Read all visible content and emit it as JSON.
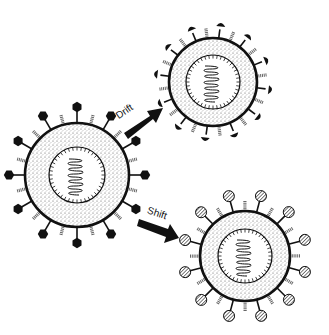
{
  "diagram": {
    "labels": {
      "drift": "Drift",
      "shift": "Shift"
    },
    "viruses": [
      {
        "id": "original",
        "cx": 77,
        "cy": 175,
        "r": 52,
        "core_r": 28,
        "spike_type": "hexagon"
      },
      {
        "id": "drift-variant",
        "cx": 213,
        "cy": 82,
        "r": 44,
        "core_r": 27,
        "spike_type": "modified-blob"
      },
      {
        "id": "shift-variant",
        "cx": 245,
        "cy": 256,
        "r": 45,
        "core_r": 27,
        "spike_type": "hatched-circle"
      }
    ],
    "colors": {
      "ink": "#111111",
      "background": "#ffffff",
      "stipple": "#555555"
    }
  }
}
